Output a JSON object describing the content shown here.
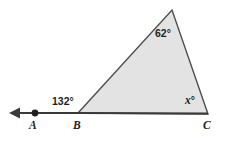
{
  "figure": {
    "type": "geometry-diagram",
    "background_color": "#ffffff",
    "triangle": {
      "fill_color": "#e3e3e3",
      "stroke_color": "#4d4d4d",
      "stroke_width": 1.4,
      "vertices": {
        "B": {
          "x": 78,
          "y": 113
        },
        "apex": {
          "x": 172,
          "y": 10
        },
        "C": {
          "x": 208,
          "y": 114
        }
      }
    },
    "ray": {
      "stroke_color": "#3a3a3a",
      "stroke_width": 2.2,
      "from": {
        "x": 78,
        "y": 113
      },
      "to": {
        "x": 14,
        "y": 113
      },
      "arrowhead": "left-pointing-solid-triangle"
    },
    "point_marker": {
      "name": "point-a-dot",
      "x": 35,
      "y": 113,
      "radius": 3.4,
      "fill_color": "#231f20"
    },
    "angles": [
      {
        "id": "angle-b",
        "label": "132°",
        "value": 132,
        "at_vertex": "B",
        "kind": "exterior"
      },
      {
        "id": "angle-apex",
        "label": "62°",
        "value": 62,
        "at_vertex": "apex",
        "kind": "interior"
      },
      {
        "id": "angle-c",
        "label": "°",
        "variable": "x",
        "value": null,
        "at_vertex": "C",
        "kind": "interior"
      }
    ],
    "vertex_labels": [
      {
        "id": "vertex-a",
        "label": "A"
      },
      {
        "id": "vertex-b",
        "label": "B"
      },
      {
        "id": "vertex-c",
        "label": "C"
      }
    ],
    "label_colors": {
      "text": "#231f20"
    }
  }
}
